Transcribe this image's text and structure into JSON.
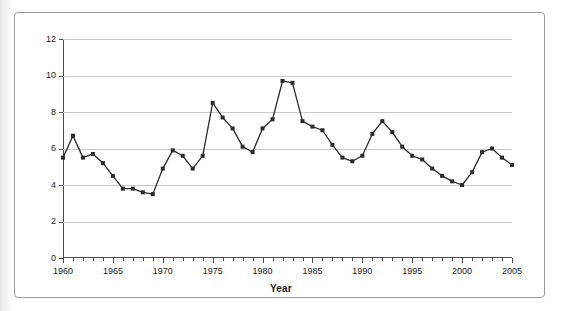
{
  "chart_data": {
    "type": "line",
    "title": "",
    "xlabel": "Year",
    "ylabel": "Percent",
    "xlim": [
      1960,
      2005
    ],
    "ylim": [
      0,
      12
    ],
    "ytick_interval": 2,
    "xtick_interval": 1,
    "xlabel_interval": 5,
    "grid": "horizontal",
    "legend": "none",
    "marker": "square",
    "series_color": "#2b2b2b",
    "x": [
      1960,
      1961,
      1962,
      1963,
      1964,
      1965,
      1966,
      1967,
      1968,
      1969,
      1970,
      1971,
      1972,
      1973,
      1974,
      1975,
      1976,
      1977,
      1978,
      1979,
      1980,
      1981,
      1982,
      1983,
      1984,
      1985,
      1986,
      1987,
      1988,
      1989,
      1990,
      1991,
      1992,
      1993,
      1994,
      1995,
      1996,
      1997,
      1998,
      1999,
      2000,
      2001,
      2002,
      2003,
      2004,
      2005
    ],
    "values": [
      5.5,
      6.7,
      5.5,
      5.7,
      5.2,
      4.5,
      3.8,
      3.8,
      3.6,
      3.5,
      4.9,
      5.9,
      5.6,
      4.9,
      5.6,
      8.5,
      7.7,
      7.1,
      6.1,
      5.8,
      7.1,
      7.6,
      9.7,
      9.6,
      7.5,
      7.2,
      7.0,
      6.2,
      5.5,
      5.3,
      5.6,
      6.8,
      7.5,
      6.9,
      6.1,
      5.6,
      5.4,
      4.9,
      4.5,
      4.2,
      4.0,
      4.7,
      5.8,
      6.0,
      5.5,
      5.1
    ],
    "ytick_labels": [
      "0",
      "2",
      "4",
      "6",
      "8",
      "10",
      "12"
    ],
    "xtick_labels": [
      "1960",
      "1965",
      "1970",
      "1975",
      "1980",
      "1985",
      "1990",
      "1995",
      "2000",
      "2005"
    ]
  },
  "figure": {
    "source_note": ""
  }
}
